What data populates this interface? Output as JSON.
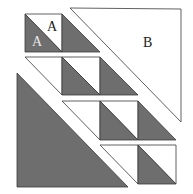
{
  "diagram": {
    "type": "quilt-block-piecing",
    "colors": {
      "dark": "#6e6e6e",
      "light": "#ffffff",
      "stroke": "#3a3a3a",
      "label_dark": "#1a1a1a",
      "label_light": "#e8e8e8"
    },
    "labels": {
      "a_top": "A",
      "a_bottom": "A",
      "b": "B"
    },
    "pieces": {
      "b_triangle": "large light triangle B",
      "large_dark_triangle": "large dark triangle",
      "rows": [
        {
          "row": 1,
          "units": [
            "half-square triangle (A/A)",
            "dark triangle"
          ]
        },
        {
          "row": 2,
          "units": [
            "light triangle",
            "half-square triangle",
            "dark triangle"
          ]
        },
        {
          "row": 3,
          "units": [
            "light triangle",
            "half-square triangle",
            "dark triangle"
          ]
        },
        {
          "row": 4,
          "units": [
            "light triangle",
            "half-square triangle"
          ]
        }
      ]
    }
  }
}
